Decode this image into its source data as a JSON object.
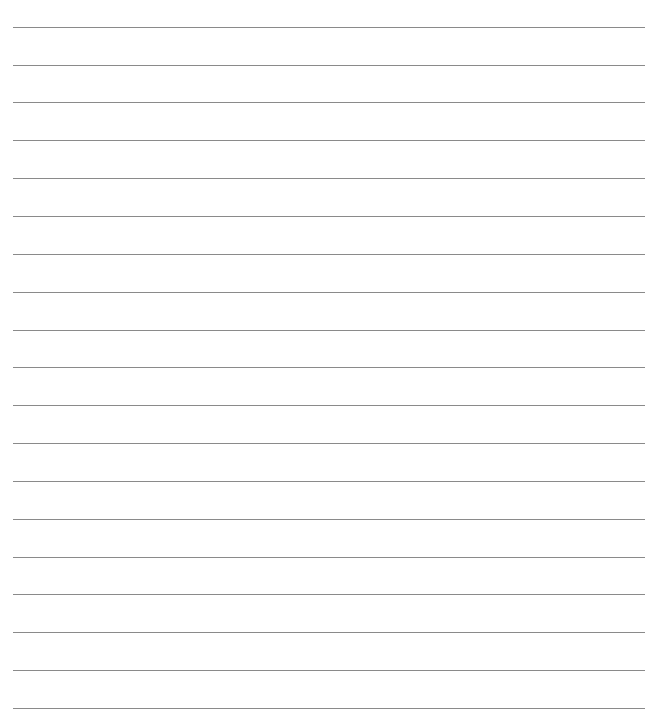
{
  "page": {
    "type": "lined-paper",
    "background_color": "#ffffff",
    "line_color": "#8a8a8a",
    "line_count": 19,
    "line_positions_y": [
      27,
      65,
      102,
      140,
      178,
      216,
      254,
      292,
      330,
      367,
      405,
      443,
      481,
      519,
      557,
      594,
      632,
      670,
      708
    ],
    "line_start_x": 13,
    "line_end_x": 645,
    "text": ""
  }
}
